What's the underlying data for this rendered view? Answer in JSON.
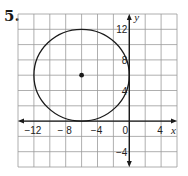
{
  "problem": {
    "number": "5."
  },
  "chart_data": {
    "type": "scatter",
    "title": "",
    "xlabel": "x",
    "ylabel": "y",
    "xlim": [
      -14,
      6
    ],
    "ylim": [
      -6,
      14
    ],
    "grid": true,
    "grid_step": 2,
    "x_ticks": [
      {
        "value": -12,
        "label": "−12"
      },
      {
        "value": -8,
        "label": "− 8"
      },
      {
        "value": -4,
        "label": "−4"
      },
      {
        "value": 0,
        "label": "0"
      },
      {
        "value": 4,
        "label": "4"
      }
    ],
    "y_ticks": [
      {
        "value": 12,
        "label": "12"
      },
      {
        "value": 8,
        "label": "8"
      },
      {
        "value": 4,
        "label": "4"
      },
      {
        "value": -4,
        "label": "−4"
      }
    ],
    "shapes": [
      {
        "kind": "circle",
        "center": [
          -6,
          6
        ],
        "radius": 6
      }
    ],
    "points": [
      {
        "x": -6,
        "y": 6,
        "label": "center"
      }
    ]
  },
  "colors": {
    "grid": "#9a9a9a",
    "axis": "#1a1a1a",
    "curve": "#1a1a1a"
  }
}
